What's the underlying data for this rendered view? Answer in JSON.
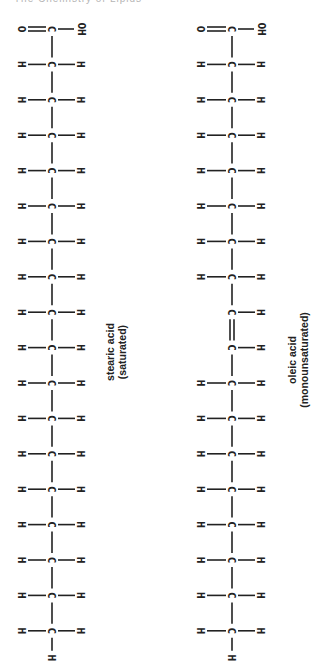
{
  "header": {
    "partial_text": "The Chemistry of Lipids"
  },
  "molecules": [
    {
      "id": "stearic",
      "name": "stearic acid",
      "classification": "(saturated)",
      "carbon_count": 18,
      "head_group": [
        "O",
        "C",
        "OH"
      ],
      "double_bond_after_carbon": null
    },
    {
      "id": "oleic",
      "name": "oleic acid",
      "classification": "(monounsaturated)",
      "carbon_count": 18,
      "head_group": [
        "O",
        "C",
        "OH"
      ],
      "double_bond_after_carbon": 9
    }
  ],
  "atoms": {
    "carbon": "C",
    "hydrogen": "H",
    "oxygen": "O",
    "hydroxyl": "OH"
  }
}
